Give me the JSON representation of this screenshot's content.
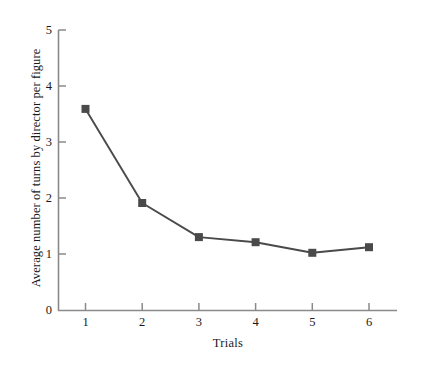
{
  "chart_data": {
    "type": "line",
    "title": "",
    "subtitle": "",
    "xlabel": "Trials",
    "ylabel": "Average number of turns by director per figure",
    "categories": [
      "1",
      "2",
      "3",
      "4",
      "5",
      "6"
    ],
    "x": [
      1,
      2,
      3,
      4,
      5,
      6
    ],
    "values": [
      3.6,
      1.92,
      1.31,
      1.22,
      1.03,
      1.13
    ],
    "series": [
      {
        "name": "Average number of turns by director per figure",
        "values": [
          3.6,
          1.92,
          1.31,
          1.22,
          1.03,
          1.13
        ]
      }
    ],
    "xlim": [
      0.5,
      6.9
    ],
    "ylim": [
      0,
      5
    ],
    "xticks": [
      "1",
      "2",
      "3",
      "4",
      "5",
      "6"
    ],
    "yticks": [
      "0",
      "1",
      "2",
      "3",
      "4",
      "5"
    ],
    "grid": false,
    "legend": false,
    "legend_position": "none",
    "marker": "square",
    "marker_color": "#4a4a4a",
    "line_color": "#4a4a4a",
    "axis_color": "#808080",
    "background_color": "#ffffff"
  },
  "axes": {
    "y_tick_labels": [
      "5",
      "4",
      "3",
      "2",
      "1",
      "0"
    ],
    "x_tick_labels": [
      "1",
      "2",
      "3",
      "4",
      "5",
      "6"
    ],
    "y_axis_title": "Average number of turns by director per figure",
    "x_axis_title": "Trials"
  }
}
